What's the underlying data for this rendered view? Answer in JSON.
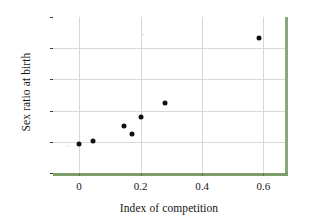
{
  "chart_data": {
    "type": "scatter",
    "title": "",
    "xlabel": "Index of competition",
    "ylabel": "Sex ratio at birth",
    "xlim": [
      -0.085,
      0.67
    ],
    "ylim": [
      0.45,
      0.7
    ],
    "grid": true,
    "legend": "none",
    "xticks": [
      "0",
      "0.2",
      "0.4",
      "0.6"
    ],
    "xtick_values": [
      0,
      0.2,
      0.4,
      0.6
    ],
    "yticks": [
      "0.45",
      "0.50",
      "0.55",
      "0.60",
      "0.65",
      "0.70"
    ],
    "ytick_values": [
      0.45,
      0.5,
      0.55,
      0.6,
      0.65,
      0.7
    ],
    "series": [
      {
        "name": "observations",
        "marker": "filled-circle",
        "color": "#111111",
        "points": [
          {
            "x": 0.0,
            "y": 0.497
          },
          {
            "x": 0.046,
            "y": 0.502
          },
          {
            "x": 0.145,
            "y": 0.525
          },
          {
            "x": 0.172,
            "y": 0.512
          },
          {
            "x": 0.2,
            "y": 0.54
          },
          {
            "x": 0.28,
            "y": 0.562
          },
          {
            "x": 0.585,
            "y": 0.666
          }
        ]
      }
    ]
  },
  "style": {
    "frame_accent_color": "#7d9d6b",
    "frame_line_color": "#3b3b3b",
    "grid_color": "#d8d8d8",
    "marker_color": "#111111",
    "background": "#ffffff"
  }
}
